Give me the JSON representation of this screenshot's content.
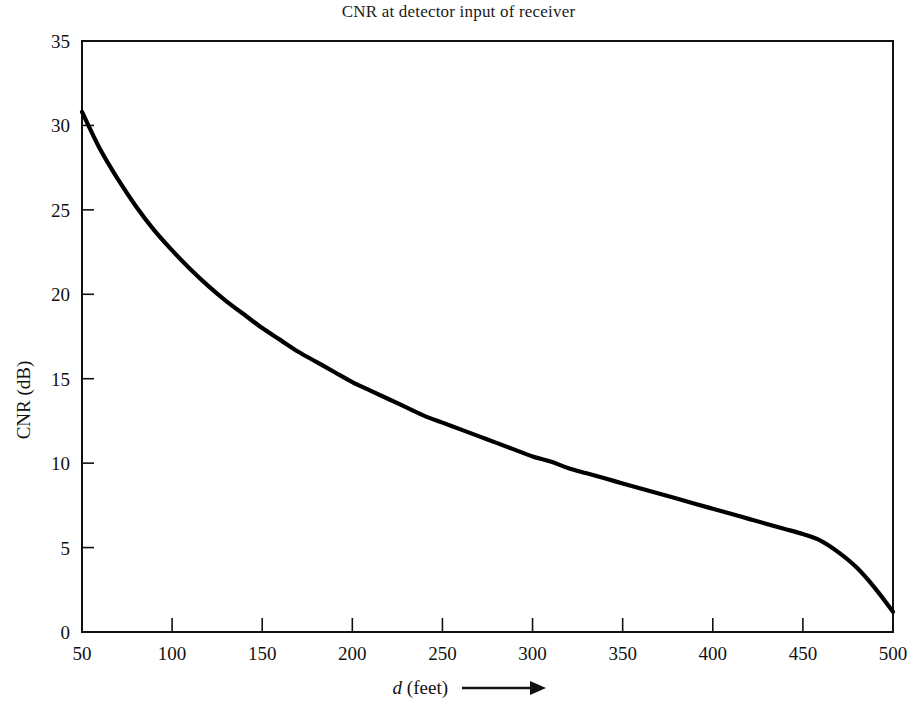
{
  "chart_data": {
    "type": "line",
    "title": "CNR at detector input of receiver",
    "xlabel": "d (feet)",
    "xlabel_italic_prefix": "d",
    "xlabel_rest": " (feet)",
    "xlabel_arrow": "⟶",
    "ylabel": "CNR (dB)",
    "xlim": [
      50,
      500
    ],
    "ylim": [
      0,
      35
    ],
    "xticks": [
      50,
      100,
      150,
      200,
      250,
      300,
      350,
      400,
      450,
      500
    ],
    "xtick_labels": [
      "50",
      "100",
      "150",
      "200",
      "250",
      "300",
      "350",
      "400",
      "450",
      "500"
    ],
    "yticks": [
      0,
      5,
      10,
      15,
      20,
      25,
      30,
      35
    ],
    "ytick_labels": [
      "0",
      "5",
      "10",
      "15",
      "20",
      "25",
      "30",
      "35"
    ],
    "grid": false,
    "legend": null,
    "series": [
      {
        "name": "CNR",
        "color": "#000000",
        "x": [
          50,
          60,
          70,
          80,
          90,
          100,
          110,
          120,
          130,
          140,
          150,
          160,
          170,
          180,
          190,
          200,
          210,
          220,
          230,
          240,
          250,
          260,
          270,
          280,
          290,
          300,
          310,
          320,
          330,
          340,
          350,
          360,
          370,
          380,
          390,
          400,
          410,
          420,
          430,
          440,
          450,
          460,
          470,
          480,
          490,
          500
        ],
        "y": [
          30.8,
          28.6,
          26.8,
          25.2,
          23.8,
          22.6,
          21.5,
          20.5,
          19.6,
          18.8,
          18.0,
          17.3,
          16.6,
          16.0,
          15.4,
          14.8,
          14.3,
          13.8,
          13.3,
          12.8,
          12.4,
          12.0,
          11.6,
          11.2,
          10.8,
          10.4,
          10.1,
          9.7,
          9.4,
          9.1,
          8.8,
          8.5,
          8.2,
          7.9,
          7.6,
          7.3,
          7.0,
          6.7,
          6.4,
          6.1,
          5.8,
          5.4,
          4.7,
          3.8,
          2.6,
          1.2
        ]
      }
    ],
    "curve_reference_points": [
      {
        "d": 50,
        "cnr": 30.8
      },
      {
        "d": 100,
        "cnr": 22.5
      },
      {
        "d": 150,
        "cnr": 18.0
      },
      {
        "d": 200,
        "cnr": 14.8
      },
      {
        "d": 250,
        "cnr": 12.4
      },
      {
        "d": 300,
        "cnr": 10.4
      },
      {
        "d": 350,
        "cnr": 8.8
      },
      {
        "d": 400,
        "cnr": 7.3
      },
      {
        "d": 450,
        "cnr": 5.8
      },
      {
        "d": 500,
        "cnr": 1.2
      }
    ]
  }
}
